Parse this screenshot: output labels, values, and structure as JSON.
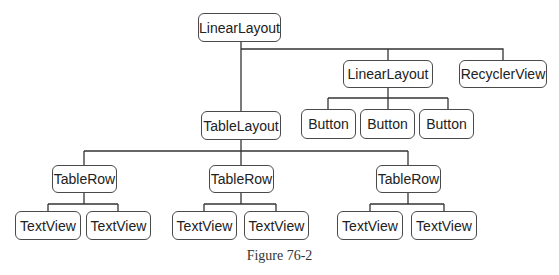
{
  "diagram": {
    "nodes": [
      {
        "id": "root",
        "label": "LinearLayout",
        "x": 198,
        "y": 13,
        "w": 83,
        "h": 29
      },
      {
        "id": "ll2",
        "label": "LinearLayout",
        "x": 343,
        "y": 60,
        "w": 90,
        "h": 28
      },
      {
        "id": "rv",
        "label": "RecyclerView",
        "x": 459,
        "y": 60,
        "w": 88,
        "h": 28
      },
      {
        "id": "btn1",
        "label": "Button",
        "x": 301,
        "y": 109,
        "w": 55,
        "h": 30
      },
      {
        "id": "btn2",
        "label": "Button",
        "x": 360,
        "y": 109,
        "w": 55,
        "h": 30
      },
      {
        "id": "btn3",
        "label": "Button",
        "x": 419,
        "y": 109,
        "w": 55,
        "h": 30
      },
      {
        "id": "tl",
        "label": "TableLayout",
        "x": 201,
        "y": 111,
        "w": 80,
        "h": 29
      },
      {
        "id": "tr1",
        "label": "TableRow",
        "x": 52,
        "y": 165,
        "w": 65,
        "h": 28
      },
      {
        "id": "tr2",
        "label": "TableRow",
        "x": 209,
        "y": 165,
        "w": 65,
        "h": 28
      },
      {
        "id": "tr3",
        "label": "TableRow",
        "x": 376,
        "y": 165,
        "w": 65,
        "h": 28
      },
      {
        "id": "tv1",
        "label": "TextView",
        "x": 15,
        "y": 211,
        "w": 66,
        "h": 29
      },
      {
        "id": "tv2",
        "label": "TextView",
        "x": 86,
        "y": 211,
        "w": 65,
        "h": 29
      },
      {
        "id": "tv3",
        "label": "TextView",
        "x": 172,
        "y": 211,
        "w": 65,
        "h": 29
      },
      {
        "id": "tv4",
        "label": "TextView",
        "x": 244,
        "y": 211,
        "w": 65,
        "h": 29
      },
      {
        "id": "tv5",
        "label": "TextView",
        "x": 337,
        "y": 211,
        "w": 66,
        "h": 29
      },
      {
        "id": "tv6",
        "label": "TextView",
        "x": 411,
        "y": 211,
        "w": 66,
        "h": 29
      }
    ],
    "edges": [
      [
        "root",
        "tl"
      ],
      [
        "root",
        "ll2"
      ],
      [
        "root",
        "rv"
      ],
      [
        "ll2",
        "btn1"
      ],
      [
        "ll2",
        "btn2"
      ],
      [
        "ll2",
        "btn3"
      ],
      [
        "tl",
        "tr1"
      ],
      [
        "tl",
        "tr2"
      ],
      [
        "tl",
        "tr3"
      ],
      [
        "tr1",
        "tv1"
      ],
      [
        "tr1",
        "tv2"
      ],
      [
        "tr2",
        "tv3"
      ],
      [
        "tr2",
        "tv4"
      ],
      [
        "tr3",
        "tv5"
      ],
      [
        "tr3",
        "tv6"
      ]
    ],
    "caption": "Figure 76-2"
  }
}
